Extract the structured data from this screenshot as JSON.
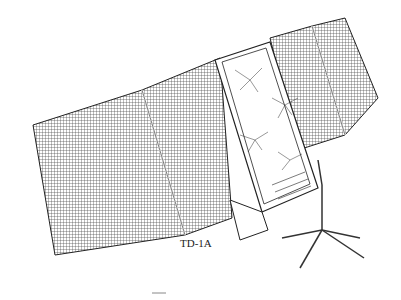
{
  "illustration": {
    "subject": "satellite line drawing",
    "caption": "TD-1A",
    "colors": {
      "ink": "#222222",
      "panel": "#555555",
      "background": "#ffffff"
    }
  }
}
